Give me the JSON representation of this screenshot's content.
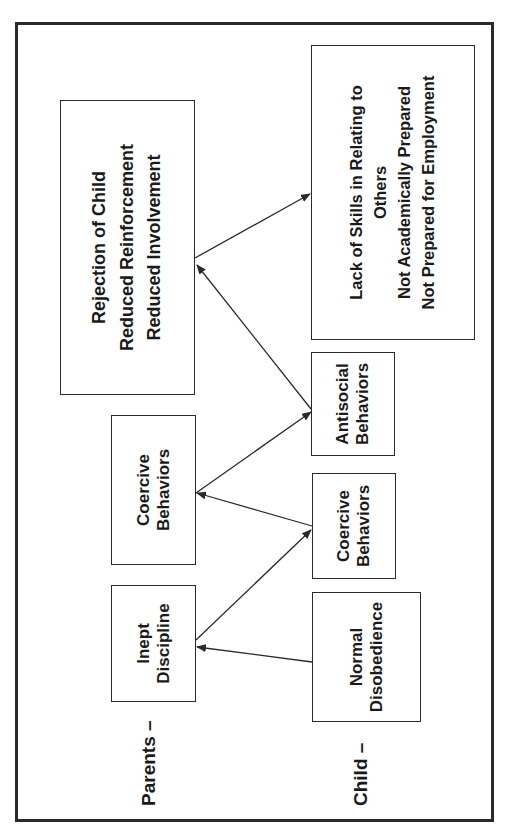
{
  "diagram": {
    "row_labels": {
      "parents": "Parents –",
      "child": "Child –"
    },
    "parents_row": {
      "inept_discipline": [
        "Inept",
        "Discipline"
      ],
      "coercive_behaviors": [
        "Coercive",
        "Behaviors"
      ],
      "rejection": [
        "Rejection of Child",
        "Reduced Reinforcement",
        "Reduced Involvement"
      ]
    },
    "child_row": {
      "normal_disobedience": [
        "Normal",
        "Disobedience"
      ],
      "coercive_behaviors": [
        "Coercive",
        "Behaviors"
      ],
      "antisocial_behaviors": [
        "Antisocial",
        "Behaviors"
      ]
    },
    "outcomes": [
      "Lack of Skills in Relating to",
      "Others",
      "Not Academically Prepared",
      "Not Prepared for Employment"
    ],
    "edges": [
      {
        "from": "Normal Disobedience",
        "to": "Inept Discipline"
      },
      {
        "from": "Inept Discipline",
        "to": "Coercive Behaviors (child)"
      },
      {
        "from": "Coercive Behaviors (child)",
        "to": "Coercive Behaviors (parents)"
      },
      {
        "from": "Coercive Behaviors (parents)",
        "to": "Antisocial Behaviors"
      },
      {
        "from": "Antisocial Behaviors",
        "to": "Rejection of Child / Reduced Reinforcement / Reduced Involvement"
      },
      {
        "from": "Rejection of Child / Reduced Reinforcement / Reduced Involvement",
        "to": "Outcomes"
      }
    ],
    "colors": {
      "line": "#2a2a2a",
      "background": "#ffffff"
    }
  }
}
